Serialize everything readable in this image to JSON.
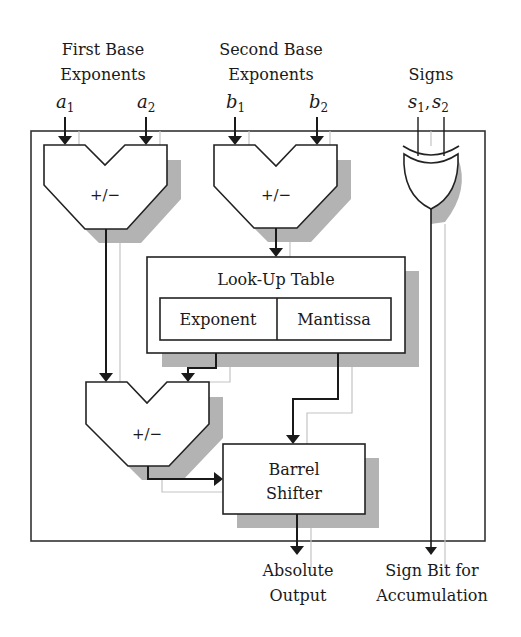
{
  "inputs": {
    "first": {
      "title_line1": "First Base",
      "title_line2": "Exponents",
      "var1": "a",
      "sub1": "1",
      "var2": "a",
      "sub2": "2"
    },
    "second": {
      "title_line1": "Second Base",
      "title_line2": "Exponents",
      "var1": "b",
      "sub1": "1",
      "var2": "b",
      "sub2": "2"
    },
    "signs": {
      "title": "Signs",
      "var1": "s",
      "sub1": "1",
      "sep": ",",
      "var2": "s",
      "sub2": "2"
    }
  },
  "blocks": {
    "alu1": {
      "label": "+/−"
    },
    "alu2": {
      "label": "+/−"
    },
    "alu3": {
      "label": "+/−"
    },
    "lut": {
      "title": "Look-Up Table",
      "col1": "Exponent",
      "col2": "Mantissa"
    },
    "barrel": {
      "line1": "Barrel",
      "line2": "Shifter"
    },
    "xor_gate": {
      "type": "XOR"
    }
  },
  "outputs": {
    "absolute": {
      "line1": "Absolute",
      "line2": "Output"
    },
    "sign": {
      "line1": "Sign Bit for",
      "line2": "Accumulation"
    }
  },
  "colors": {
    "line": "#1a1a1a",
    "shadow": "#b3b3b3",
    "ghost_line": "#c4c4c4",
    "background": "#ffffff"
  }
}
